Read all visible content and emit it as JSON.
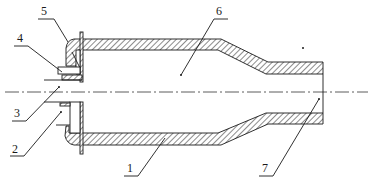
{
  "figure": {
    "type": "cross-section technical drawing",
    "colors": {
      "line": "#1a1a1a",
      "background": "#ffffff"
    }
  },
  "labels": [
    {
      "id": "1",
      "text": "1",
      "part": "outer-tube-wall"
    },
    {
      "id": "2",
      "text": "2",
      "part": "annular-inlet-lower"
    },
    {
      "id": "3",
      "text": "3",
      "part": "central-inlet"
    },
    {
      "id": "4",
      "text": "4",
      "part": "inlet-nozzle-upper"
    },
    {
      "id": "5",
      "text": "5",
      "part": "head-flange"
    },
    {
      "id": "6",
      "text": "6",
      "part": "chamber-interior"
    },
    {
      "id": "7",
      "text": "7",
      "part": "outlet"
    }
  ]
}
